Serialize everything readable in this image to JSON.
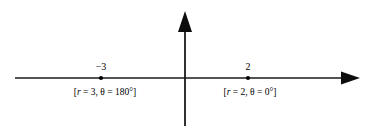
{
  "figure": {
    "type": "number-line-diagram",
    "background_color": "#ffffff",
    "line_color": "#1a1a1a",
    "text_color": "#000000",
    "axes": {
      "horizontal": {
        "name": "polar-axis",
        "y": 78,
        "x_start": 15,
        "x_end": 360,
        "arrow_end": "right"
      },
      "vertical": {
        "name": "vertical-axis",
        "x": 185,
        "y_start": 12,
        "y_end": 126,
        "arrow_end": "top"
      },
      "origin": {
        "x": 185,
        "y": 78
      }
    },
    "points": [
      {
        "id": "point-negative-three",
        "x": 101,
        "value_label": "−3",
        "polar_label_prefix": "[",
        "polar_r_symbol": "r",
        "polar_r_value": " = 3, ",
        "polar_theta_symbol": "θ",
        "polar_theta_value": " = 180°]",
        "polar_label_full": "[r = 3, θ = 180°]",
        "r": 3,
        "theta_degrees": 180
      },
      {
        "id": "point-two",
        "x": 248,
        "value_label": "2",
        "polar_label_prefix": "[",
        "polar_r_symbol": "r",
        "polar_r_value": " = 2, ",
        "polar_theta_symbol": "θ",
        "polar_theta_value": " = 0°]",
        "polar_label_full": "[r = 2, θ = 0°]",
        "r": 2,
        "theta_degrees": 0
      }
    ]
  }
}
